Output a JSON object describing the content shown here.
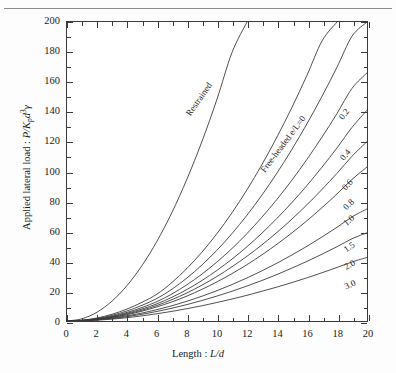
{
  "figure": {
    "background_color": "#ffffff",
    "line_color": "#3a3a3a",
    "text_color": "#1a1a1a",
    "top_rule": true
  },
  "axes": {
    "x": {
      "title_prefix": "Length : ",
      "title_symbol": "L/d",
      "min": 0,
      "max": 20,
      "major_step": 2,
      "minor_step": 1,
      "ticks": [
        0,
        2,
        4,
        6,
        8,
        10,
        12,
        14,
        16,
        18,
        20
      ],
      "tick_labels": [
        "0",
        "2",
        "4",
        "6",
        "8",
        "10",
        "12",
        "14",
        "16",
        "18",
        "20"
      ]
    },
    "y": {
      "title_prefix": "Applied lateral load : ",
      "title_symbol": "P/K",
      "title_sub": "p",
      "title_sym2": "d",
      "title_sup": "3",
      "title_sym3": "γ",
      "min": 0,
      "max": 200,
      "major_step": 20,
      "minor_step": 10,
      "ticks": [
        0,
        20,
        40,
        60,
        80,
        100,
        120,
        140,
        160,
        180,
        200
      ],
      "tick_labels": [
        "0",
        "20",
        "40",
        "60",
        "80",
        "100",
        "120",
        "140",
        "160",
        "180",
        "200"
      ]
    }
  },
  "annotations": [
    {
      "name": "restrained-label",
      "text": "Restrained",
      "x": 9.0,
      "y": 150,
      "angle": -55
    },
    {
      "name": "free-headed-label",
      "text": "Free-headed e/L=0",
      "x": 14.6,
      "y": 120,
      "angle": -53
    },
    {
      "name": "curve-label-0.2",
      "text": "0.2",
      "x": 18.6,
      "y": 140,
      "angle": -52
    },
    {
      "name": "curve-label-0.4",
      "text": "0.4",
      "x": 18.7,
      "y": 113,
      "angle": -50
    },
    {
      "name": "curve-label-0.6",
      "text": "0.6",
      "x": 18.8,
      "y": 93,
      "angle": -47
    },
    {
      "name": "curve-label-0.8",
      "text": "0.8",
      "x": 18.9,
      "y": 80,
      "angle": -44
    },
    {
      "name": "curve-label-1.0",
      "text": "1.0",
      "x": 18.9,
      "y": 69,
      "angle": -41
    },
    {
      "name": "curve-label-1.5",
      "text": "1.5",
      "x": 18.9,
      "y": 51,
      "angle": -35
    },
    {
      "name": "curve-label-2.0",
      "text": "2.0",
      "x": 18.9,
      "y": 39,
      "angle": -30
    },
    {
      "name": "curve-label-3.0",
      "text": "3.0",
      "x": 18.9,
      "y": 26,
      "angle": -24
    }
  ],
  "chart_data": {
    "type": "line",
    "title": "",
    "xlabel": "Length : L/d",
    "ylabel": "Applied lateral load : P/Kp d3 γ",
    "xlim": [
      0,
      20
    ],
    "ylim": [
      0,
      200
    ],
    "grid": false,
    "legend": "inline curve labels at right edge",
    "x": [
      0,
      1,
      2,
      3,
      4,
      5,
      6,
      7,
      8,
      9,
      10,
      11,
      12,
      13,
      14,
      15,
      16,
      17,
      18,
      19,
      20
    ],
    "series": [
      {
        "name": "Restrained",
        "label": "Restrained",
        "clipped_at_top": true,
        "values": [
          0,
          1.5,
          5.9,
          13.3,
          23.7,
          37.1,
          53.4,
          72.7,
          95,
          120.2,
          148.4,
          179.6,
          200,
          null,
          null,
          null,
          null,
          null,
          null,
          null,
          null
        ]
      },
      {
        "name": "Free-headed e/L=0",
        "label": "Free-headed e/L=0",
        "values": [
          0,
          0.5,
          2.0,
          4.5,
          8.0,
          12.5,
          18.0,
          25.8,
          35.2,
          46.1,
          58.5,
          72.4,
          87.8,
          104.7,
          123.1,
          143.0,
          164.4,
          187.3,
          200,
          null,
          null
        ]
      },
      {
        "name": "e/L=0.2",
        "label": "0.2",
        "values": [
          0,
          0.42,
          1.68,
          3.78,
          6.72,
          10.5,
          15.1,
          21.3,
          28.8,
          37.5,
          47.4,
          58.5,
          70.8,
          84.3,
          99.0,
          114.9,
          132.0,
          150.3,
          169.8,
          190.5,
          200
        ]
      },
      {
        "name": "e/L=0.4",
        "label": "0.4",
        "values": [
          0,
          0.36,
          1.44,
          3.24,
          5.76,
          9.0,
          13.0,
          18.1,
          24.3,
          31.4,
          39.5,
          48.5,
          58.5,
          69.5,
          81.4,
          94.3,
          108.2,
          123.0,
          138.8,
          155.6,
          166.0
        ]
      },
      {
        "name": "e/L=0.6",
        "label": "0.6",
        "values": [
          0,
          0.32,
          1.28,
          2.88,
          5.12,
          8.0,
          11.5,
          15.9,
          21.1,
          27.1,
          33.9,
          41.4,
          49.7,
          58.8,
          68.7,
          79.3,
          90.7,
          102.9,
          115.8,
          129.5,
          141.0
        ]
      },
      {
        "name": "e/L=0.8",
        "label": "0.8",
        "values": [
          0,
          0.29,
          1.16,
          2.61,
          4.64,
          7.25,
          10.4,
          14.3,
          18.8,
          24.0,
          29.8,
          36.3,
          43.3,
          51.0,
          59.3,
          68.2,
          77.8,
          88.0,
          98.8,
          110.2,
          120.0
        ]
      },
      {
        "name": "e/L=1.0",
        "label": "1.0",
        "values": [
          0,
          0.26,
          1.05,
          2.36,
          4.2,
          6.56,
          9.45,
          12.8,
          16.7,
          21.2,
          26.2,
          31.7,
          37.7,
          44.3,
          51.4,
          59.0,
          67.1,
          75.8,
          85.0,
          94.7,
          103.0
        ]
      },
      {
        "name": "e/L=1.5",
        "label": "1.5",
        "values": [
          0,
          0.21,
          0.85,
          1.91,
          3.4,
          5.31,
          7.6,
          10.2,
          13.2,
          16.6,
          20.3,
          24.4,
          28.8,
          33.6,
          38.7,
          44.2,
          50.0,
          56.2,
          62.7,
          69.6,
          75.0
        ]
      },
      {
        "name": "e/L=2.0",
        "label": "2.0",
        "values": [
          0,
          0.18,
          0.72,
          1.62,
          2.88,
          4.5,
          6.4,
          8.55,
          11.0,
          13.7,
          16.7,
          19.9,
          23.4,
          27.1,
          31.1,
          35.4,
          39.9,
          44.7,
          49.7,
          55.0,
          59.0
        ]
      },
      {
        "name": "e/L=3.0",
        "label": "3.0",
        "values": [
          0,
          0.14,
          0.55,
          1.24,
          2.2,
          3.44,
          4.85,
          6.45,
          8.25,
          10.2,
          12.4,
          14.7,
          17.2,
          19.9,
          22.7,
          25.7,
          28.9,
          32.3,
          35.8,
          39.5,
          42.5
        ]
      }
    ]
  }
}
